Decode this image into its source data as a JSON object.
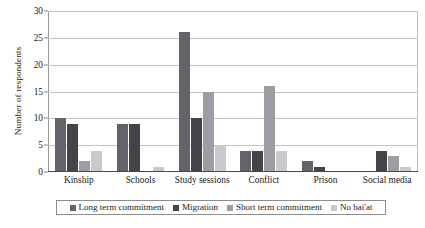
{
  "chart_data": {
    "type": "bar",
    "title": "",
    "xlabel": "",
    "ylabel": "Number of respondents",
    "ylim": [
      0,
      30
    ],
    "ytick_step": 5,
    "yticks": [
      0,
      5,
      10,
      15,
      20,
      25,
      30
    ],
    "grid": "horizontal",
    "legend_position": "bottom",
    "categories": [
      "Kinship",
      "Schools",
      "Study sessions",
      "Conflict",
      "Prison",
      "Social media"
    ],
    "series": [
      {
        "name": "Long term commitment",
        "color": "#63646a",
        "values": [
          10,
          9,
          26,
          4,
          2,
          0
        ]
      },
      {
        "name": "Migration",
        "color": "#434349",
        "values": [
          9,
          9,
          10,
          4,
          1,
          4
        ]
      },
      {
        "name": "Short term commitment",
        "color": "#9d9ea3",
        "values": [
          2,
          0,
          15,
          16,
          0,
          3
        ]
      },
      {
        "name": "No bai'at",
        "color": "#c9cacd",
        "values": [
          4,
          1,
          5,
          4,
          0,
          1
        ]
      }
    ]
  },
  "axis": {
    "y_title": "Number of respondents"
  },
  "colors": {
    "gridline": "#c4c4c4",
    "baseline": "#4a4a4a",
    "legend_border": "#8d8d8d",
    "text": "#1a1a1a"
  }
}
